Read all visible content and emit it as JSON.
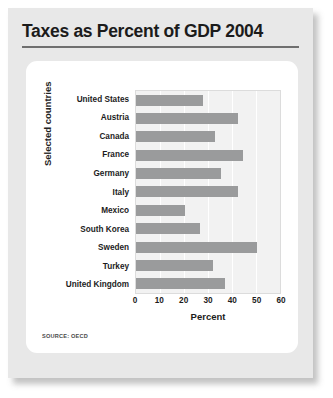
{
  "figure": {
    "title": "Taxes as Percent of GDP 2004",
    "source_note": "SOURCE: OECD"
  },
  "colors": {
    "bar": "#9a9b9c",
    "card_background": "#e8e8e8",
    "panel_background": "#ffffff",
    "plot_background": "#f2f2f2",
    "gridline": "#ffffff",
    "title_text": "#1b1b1b",
    "rule": "#6f6f6f"
  },
  "chart_data": {
    "type": "bar",
    "orientation": "horizontal",
    "title": "Taxes as Percent of GDP 2004",
    "xlabel": "Percent",
    "ylabel": "Selected countries",
    "xlim": [
      0,
      60
    ],
    "xticks": [
      0,
      10,
      20,
      30,
      40,
      50,
      60
    ],
    "xticklabels": [
      "0",
      "10",
      "20",
      "30",
      "40",
      "50",
      "60"
    ],
    "grid": true,
    "grid_axis": "x",
    "legend": false,
    "categories": [
      "United States",
      "Austria",
      "Canada",
      "France",
      "Germany",
      "Italy",
      "Mexico",
      "South Korea",
      "Sweden",
      "Turkey",
      "United Kingdom"
    ],
    "values": [
      28,
      42.5,
      33,
      44.5,
      35.5,
      42.5,
      20.5,
      26.5,
      50.5,
      32,
      37
    ]
  }
}
